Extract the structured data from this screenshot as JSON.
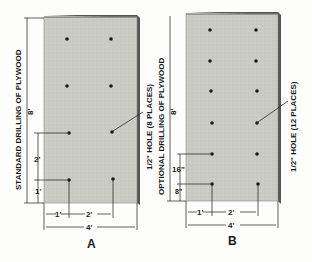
{
  "panels": [
    {
      "id": "A",
      "caption": "A",
      "side_label": "STANDARD DRILLING OF PLYWOOD",
      "hole_label": "1/2\" HOLE (8 PLACES)",
      "height_label": "8'",
      "vert_dims": [
        "2'",
        "1'"
      ],
      "horiz_dims": [
        "1'",
        "2'"
      ],
      "width_label": "4'"
    },
    {
      "id": "B",
      "caption": "B",
      "side_label": "OPTIONAL DRILLING OF PLYWOOD",
      "hole_label": "1/2\" HOLE (12 PLACES)",
      "height_label": "8'",
      "vert_dims": [
        "16\"",
        "8\""
      ],
      "horiz_dims": [
        "1'",
        "2'"
      ],
      "width_label": "4'"
    }
  ],
  "colors": {
    "panel_fill": "#c9c9c4",
    "panel_edge": "#6a6a66",
    "hole": "#1a1a1a",
    "ink": "#1a1a1a"
  }
}
